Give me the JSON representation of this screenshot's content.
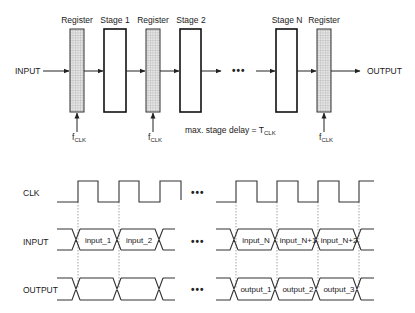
{
  "pipeline": {
    "input_label": "INPUT",
    "output_label": "OUTPUT",
    "blocks": [
      {
        "type": "register",
        "label": "Register"
      },
      {
        "type": "stage",
        "label": "Stage 1"
      },
      {
        "type": "register",
        "label": "Register"
      },
      {
        "type": "stage",
        "label": "Stage 2"
      },
      {
        "type": "stage",
        "label": "Stage N"
      },
      {
        "type": "register",
        "label": "Register"
      }
    ],
    "clock_label": "f",
    "clock_subscript": "CLK",
    "ellipsis": "•••",
    "delay_note": "max. stage delay = T",
    "delay_note_subscript": "CLK"
  },
  "timing": {
    "signals": [
      {
        "name": "CLK"
      },
      {
        "name": "INPUT",
        "left_cells": [
          "input_1",
          "input_2"
        ],
        "right_cells": [
          "input_N",
          "input_N+1",
          "input_N+2"
        ]
      },
      {
        "name": "OUTPUT",
        "left_cells": [
          "",
          ""
        ],
        "right_cells": [
          "output_1",
          "output_2",
          "output_3"
        ]
      }
    ],
    "ellipsis": "•••"
  }
}
